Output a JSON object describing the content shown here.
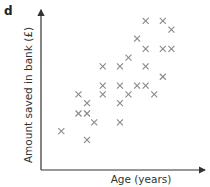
{
  "panel_label": "d",
  "chart_data": {
    "type": "scatter",
    "title": "",
    "xlabel": "Age (years)",
    "ylabel": "Amount saved in bank (£)",
    "grid": false,
    "legend": null,
    "marker": "x",
    "marker_color": "#8a8a8a",
    "axis_color": "#333333",
    "x_ticks": [],
    "y_ticks": [],
    "note": "No numeric scale shown; points given in relative units (0-100) on each axis, showing positive correlation.",
    "points": [
      {
        "x": 10,
        "y": 21
      },
      {
        "x": 22,
        "y": 46
      },
      {
        "x": 22,
        "y": 33
      },
      {
        "x": 28,
        "y": 40
      },
      {
        "x": 28,
        "y": 33
      },
      {
        "x": 28,
        "y": 15
      },
      {
        "x": 33,
        "y": 27
      },
      {
        "x": 39,
        "y": 65
      },
      {
        "x": 39,
        "y": 52
      },
      {
        "x": 39,
        "y": 46
      },
      {
        "x": 51,
        "y": 65
      },
      {
        "x": 51,
        "y": 52
      },
      {
        "x": 51,
        "y": 40
      },
      {
        "x": 51,
        "y": 27
      },
      {
        "x": 57,
        "y": 71
      },
      {
        "x": 57,
        "y": 46
      },
      {
        "x": 63,
        "y": 84
      },
      {
        "x": 63,
        "y": 52
      },
      {
        "x": 69,
        "y": 96
      },
      {
        "x": 69,
        "y": 77
      },
      {
        "x": 69,
        "y": 65
      },
      {
        "x": 69,
        "y": 52
      },
      {
        "x": 75,
        "y": 46
      },
      {
        "x": 81,
        "y": 96
      },
      {
        "x": 81,
        "y": 77
      },
      {
        "x": 81,
        "y": 58
      },
      {
        "x": 87,
        "y": 90
      },
      {
        "x": 87,
        "y": 77
      }
    ]
  }
}
